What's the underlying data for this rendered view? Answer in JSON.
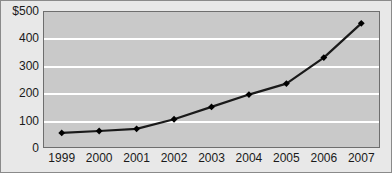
{
  "chart_data": {
    "type": "line",
    "title": "",
    "xlabel": "",
    "ylabel": "",
    "categories": [
      "1999",
      "2000",
      "2001",
      "2002",
      "2003",
      "2004",
      "2005",
      "2006",
      "2007"
    ],
    "series": [
      {
        "name": "Series 1",
        "values": [
          55,
          62,
          70,
          105,
          150,
          195,
          235,
          330,
          455
        ]
      }
    ],
    "ylim": [
      0,
      500
    ],
    "ytick_labels": [
      "$500",
      "400",
      "300",
      "200",
      "100",
      "0"
    ],
    "ytick_values": [
      500,
      400,
      300,
      200,
      100,
      0
    ],
    "grid": true,
    "legend": "none",
    "colors": {
      "plot_background": "#c9c9c9",
      "figure_background": "#e8e8e8",
      "gridline": "#ffffff",
      "line": "#1a1a1a",
      "marker": "#000000",
      "axis_border": "#6e6e6e",
      "text": "#1a1a1a"
    }
  }
}
